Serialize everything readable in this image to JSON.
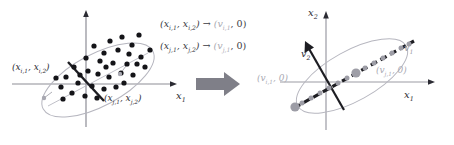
{
  "figure": {
    "background": "#ffffff",
    "ink_color": "#2b2b33",
    "faint_color": "#a9a9b2",
    "arrow_color": "#7a7a82",
    "dot_color": "#141418",
    "gray_dot_color": "#9d9da6"
  },
  "left_panel": {
    "name": "original-data-scatter",
    "axis_x_label": "x",
    "axis_x_sub": "1",
    "axis_y_label": "",
    "point_i_label": "(x",
    "labels": {
      "point_i": {
        "open": "(x",
        "s1": "i,1",
        "mid": ", x",
        "s2": "i,2",
        "close": ")"
      },
      "point_j": {
        "open": "(x",
        "s1": "j,1",
        "mid": ", x",
        "s2": "j,2",
        "close": ")"
      },
      "axis_x": {
        "base": "x",
        "sub": "1"
      }
    },
    "scatter_points": [
      [
        94,
        46
      ],
      [
        110,
        41
      ],
      [
        122,
        37
      ],
      [
        132,
        44
      ],
      [
        138,
        34
      ],
      [
        104,
        52
      ],
      [
        118,
        50
      ],
      [
        128,
        53
      ],
      [
        86,
        57
      ],
      [
        100,
        60
      ],
      [
        114,
        62
      ],
      [
        126,
        63
      ],
      [
        140,
        56
      ],
      [
        150,
        49
      ],
      [
        144,
        66
      ],
      [
        74,
        66
      ],
      [
        88,
        70
      ],
      [
        98,
        73
      ],
      [
        108,
        76
      ],
      [
        120,
        72
      ],
      [
        132,
        74
      ],
      [
        66,
        76
      ],
      [
        78,
        82
      ],
      [
        92,
        85
      ],
      [
        104,
        88
      ],
      [
        116,
        86
      ],
      [
        60,
        86
      ],
      [
        72,
        92
      ],
      [
        84,
        95
      ],
      [
        96,
        97
      ],
      [
        136,
        63
      ],
      [
        148,
        59
      ],
      [
        80,
        74
      ],
      [
        106,
        66
      ],
      [
        124,
        82
      ]
    ],
    "ellipse": {
      "cx": 105,
      "cy": 68,
      "rx": 57,
      "ry": 23,
      "rotate": -27
    },
    "axis_origin": [
      100,
      72
    ]
  },
  "center_panel": {
    "name": "mapping-equations",
    "equations": [
      {
        "lhs_open": "(x",
        "lhs_s1": "i,1",
        "lhs_mid": ", x",
        "lhs_s2": "i,2",
        "lhs_close": ")",
        "arrow": "→",
        "rhs_open": "(v",
        "rhs_s1": "i,1",
        "rhs_mid": ", 0)"
      },
      {
        "lhs_open": "(x",
        "lhs_s1": "j,1",
        "lhs_mid": ", x",
        "lhs_s2": "j,2",
        "lhs_close": ")",
        "arrow": "→",
        "rhs_open": "(v",
        "rhs_s1": "j,1",
        "rhs_mid": ", 0)"
      }
    ],
    "transform_arrow": {
      "name": "transform-arrow",
      "color": "#7f7f88"
    }
  },
  "right_panel": {
    "name": "projected-data-scatter",
    "labels": {
      "axis_x": {
        "base": "x",
        "sub": "1"
      },
      "axis_y": {
        "base": "x",
        "sub": "2"
      },
      "eigen_v1": {
        "base": "v",
        "sub": "1"
      },
      "eigen_v2": {
        "base": "v",
        "sub": "2"
      },
      "point_i": {
        "open": "(v",
        "s1": "i,1",
        "mid": ", 0)"
      },
      "point_j": {
        "open": "(v",
        "s1": "j,1",
        "mid": ", 0)"
      }
    },
    "projected_points": [
      [
        14,
        106
      ],
      [
        22,
        101
      ],
      [
        31,
        96
      ],
      [
        40,
        91
      ],
      [
        49,
        86
      ],
      [
        58,
        81
      ],
      [
        67,
        76
      ],
      [
        76,
        71
      ],
      [
        85,
        66
      ],
      [
        94,
        61
      ],
      [
        103,
        56
      ],
      [
        112,
        51
      ],
      [
        121,
        46
      ],
      [
        130,
        41
      ]
    ],
    "highlight_points": [
      [
        16,
        105
      ],
      [
        79,
        69
      ]
    ],
    "ellipse": {
      "cx": 74,
      "cy": 74,
      "rx": 58,
      "ry": 22,
      "rotate": -29
    },
    "axis_origin": [
      46,
      80
    ]
  }
}
